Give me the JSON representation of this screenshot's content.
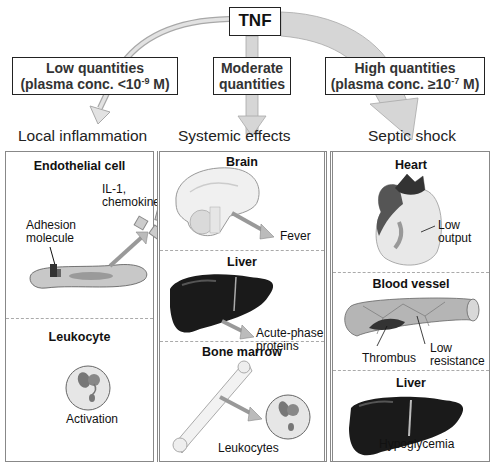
{
  "source": {
    "label": "TNF"
  },
  "quantities": [
    {
      "line1": "Low quantities",
      "line2_prefix": "(plasma conc. <10",
      "exp": "-9",
      "line2_suffix": " M)"
    },
    {
      "line1": "Moderate",
      "line2": "quantities"
    },
    {
      "line1": "High quantities",
      "line2_prefix": "(plasma conc. ≥10",
      "exp": "-7",
      "line2_suffix": " M)"
    }
  ],
  "columns": [
    {
      "title": "Local inflammation",
      "sections": [
        {
          "heading": "Endothelial cell",
          "labels": [
            "Adhesion",
            "molecule",
            "IL-1,",
            "chemokines"
          ]
        },
        {
          "heading": "Leukocyte",
          "labels": [
            "Activation"
          ]
        }
      ]
    },
    {
      "title": "Systemic effects",
      "sections": [
        {
          "heading": "Brain",
          "labels": [
            "Fever"
          ]
        },
        {
          "heading": "Liver",
          "labels": [
            "Acute-phase",
            "proteins"
          ]
        },
        {
          "heading": "Bone marrow",
          "labels": [
            "Leukocytes"
          ]
        }
      ]
    },
    {
      "title": "Septic shock",
      "sections": [
        {
          "heading": "Heart",
          "labels": [
            "Low",
            "output"
          ]
        },
        {
          "heading": "Blood vessel",
          "labels": [
            "Thrombus",
            "Low",
            "resistance"
          ]
        },
        {
          "heading": "Liver",
          "labels": [
            "Hypoglycemia"
          ]
        }
      ]
    }
  ],
  "colors": {
    "arrow_fill": "#d6d6d6",
    "arrow_stroke": "#a8a8a8",
    "liver": "#1a1a1a",
    "panel_border": "#888888"
  }
}
